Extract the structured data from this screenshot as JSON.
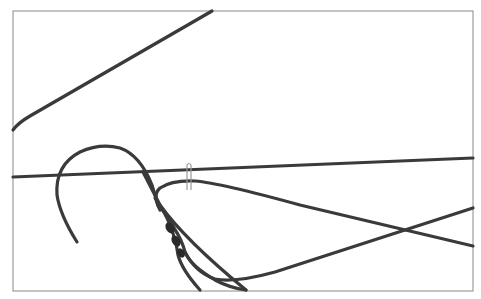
{
  "illustration": {
    "subject": "wire-hanger-line-drawing",
    "colors": {
      "background": "#ffffff",
      "frame": "#8a8a8a",
      "wire": "#3a3a3a",
      "clip": "#9a9a9a"
    }
  }
}
